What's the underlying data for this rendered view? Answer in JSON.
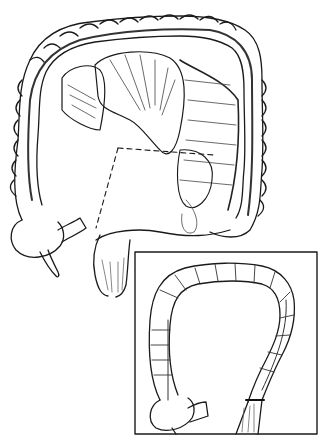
{
  "figure": {
    "main_view": {
      "description": "Colon with mesenteric vessels, dashed resection lines",
      "dashed_lines": 2
    },
    "inset_view": {
      "description": "Colon after resection, shown in bordered inset box",
      "box": {
        "x": 135,
        "y": 252,
        "width": 182,
        "height": 182
      }
    },
    "signature": "illegible artist signature",
    "colors": {
      "ink": "#1a1a1a",
      "background": "#ffffff",
      "shading": "#555555"
    }
  }
}
